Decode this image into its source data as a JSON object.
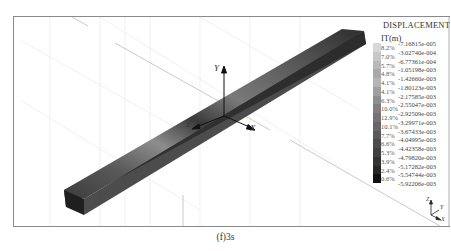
{
  "figure": {
    "caption": "(f)3s",
    "legend": {
      "title": "DISPLACEMENT",
      "unit": "IT(m)",
      "bands": [
        {
          "pct": "8.2%",
          "value": "-7.16815e-005",
          "color": "#d8d8d8"
        },
        {
          "pct": "7.0%",
          "value": "-3.02740e-004",
          "color": "#c8c8c8"
        },
        {
          "pct": "5.7%",
          "value": "-6.77361e-004",
          "color": "#b8b8b8"
        },
        {
          "pct": "4.8%",
          "value": "-1.05198e-003",
          "color": "#a9a9a9"
        },
        {
          "pct": "4.1%",
          "value": "-1.42660e-003",
          "color": "#b4b4b4"
        },
        {
          "pct": "4.1%",
          "value": "-1.80123e-003",
          "color": "#a0a0a0"
        },
        {
          "pct": "6.3%",
          "value": "-2.17585e-003",
          "color": "#8e8e8e"
        },
        {
          "pct": "10.0%",
          "value": "-2.55047e-003",
          "color": "#7f7f7f"
        },
        {
          "pct": "12.9%",
          "value": "-2.92509e-003",
          "color": "#737373"
        },
        {
          "pct": "10.1%",
          "value": "-3.29971e-003",
          "color": "#666666"
        },
        {
          "pct": "7.7%",
          "value": "-3.67433e-003",
          "color": "#595959"
        },
        {
          "pct": "6.6%",
          "value": "-4.04995e-003",
          "color": "#4c4c4c"
        },
        {
          "pct": "5.3%",
          "value": "-4.42358e-003",
          "color": "#404040"
        },
        {
          "pct": "3.9%",
          "value": "-4.79820e-003",
          "color": "#333333"
        },
        {
          "pct": "2.4%",
          "value": "-5.17282e-003",
          "color": "#262626"
        },
        {
          "pct": "0.6%",
          "value": "-5.54744e-003",
          "color": "#111111"
        }
      ],
      "last_value": "-5.92206e-003"
    },
    "axes": {
      "global": {
        "x": "X",
        "y": "Y",
        "z": "Z"
      },
      "triad": {
        "x": "X",
        "y": "Y",
        "z": "Z"
      }
    }
  }
}
